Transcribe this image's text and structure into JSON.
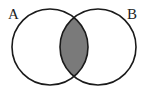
{
  "diagram": {
    "type": "venn",
    "sets": [
      {
        "label": "A",
        "cx": 50,
        "cy": 47,
        "r": 38
      },
      {
        "label": "B",
        "cx": 98,
        "cy": 47,
        "r": 38
      }
    ],
    "shaded_region": "A ∩ B",
    "colors": {
      "stroke": "#1a1a1a",
      "fill_intersection": "#7a7a7a",
      "background": "#ffffff"
    }
  }
}
